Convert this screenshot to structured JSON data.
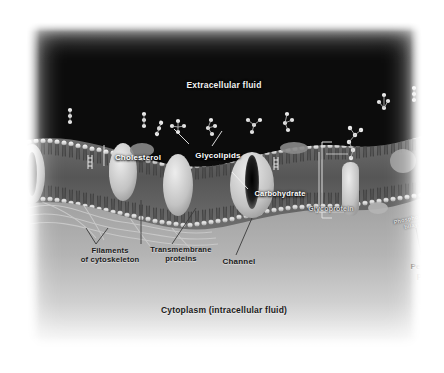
{
  "figure": {
    "palette": {
      "extracellular_bg": "#000000",
      "cytoplasm_bg": "#a8a8a8",
      "page_bg": "#ffffff",
      "membrane_head": "#e8e8e8",
      "membrane_tail": "#4a4a4a",
      "protein_fill": "#cfcfcf",
      "label_light": "#ffffff",
      "label_dark": "#1a1a1a"
    }
  },
  "regions": {
    "extracellular": "Extracellular fluid",
    "cytoplasm": "Cytoplasm (intracellular fluid)"
  },
  "labels": {
    "cholesterol": "Cholesterol",
    "glycolipids": "Glycolipids",
    "carbohydrate": "Carbohydrate",
    "glycoprotein": "Glycoprotein",
    "phospholipid_bilayer": "Phospholipid\nbilayer",
    "filaments": "Filaments\nof cytoskeleton",
    "transmembrane": "Transmembrane\nproteins",
    "channel": "Channel",
    "peripheral": "Peripheral\nprotein"
  },
  "structures": [
    {
      "name": "phospholipid-bilayer",
      "description": "Two leaflets of lipid molecules with spherical hydrophilic heads facing outward and hydrophobic tails inward"
    },
    {
      "name": "cholesterol",
      "description": "Small rigid ladder-like molecules wedged between phospholipid tails"
    },
    {
      "name": "glycolipids",
      "description": "Lipids with beaded carbohydrate chains projecting into extracellular fluid"
    },
    {
      "name": "glycoprotein",
      "description": "Integral protein with branched carbohydrate chain on its extracellular face"
    },
    {
      "name": "channel-protein",
      "description": "Large integral protein spanning the bilayer with a central dark pore"
    },
    {
      "name": "transmembrane-proteins",
      "description": "Integral proteins fully spanning the bilayer"
    },
    {
      "name": "peripheral-protein",
      "description": "Protein attached to the cytoplasmic surface of the membrane"
    },
    {
      "name": "cytoskeleton-filaments",
      "description": "Fine strands beneath the inner leaflet anchoring the membrane"
    }
  ]
}
